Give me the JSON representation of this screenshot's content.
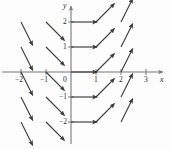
{
  "figure": {
    "background": "#fdfdfd",
    "ink_color": "#3a3a3a",
    "axis_color": "#777777",
    "width": 171,
    "height": 149
  },
  "axes": {
    "x_axis_label": "x",
    "y_axis_label": "y",
    "origin_label": "0",
    "x_ticks": [
      {
        "value": -2,
        "label": "−2",
        "px": 21
      },
      {
        "value": -1,
        "label": "−1",
        "px": 46
      },
      {
        "value": 1,
        "label": "1",
        "px": 96
      },
      {
        "value": 2,
        "label": "2",
        "px": 121
      },
      {
        "value": 3,
        "label": "3",
        "px": 146
      }
    ],
    "y_ticks": [
      {
        "value": 2,
        "label": "2",
        "px": 22
      },
      {
        "value": 1,
        "label": "1",
        "px": 47
      },
      {
        "value": -1,
        "label": "−1",
        "px": 97
      },
      {
        "value": -2,
        "label": "−2",
        "px": 122
      }
    ],
    "origin_px": {
      "x": 71,
      "y": 72
    },
    "unit_px": 25,
    "grid": false
  },
  "chart_data": {
    "type": "scatter",
    "plot_kind": "slope-field",
    "title": "",
    "xlabel": "x",
    "ylabel": "y",
    "xlim": [
      -2.9,
      3.4
    ],
    "ylim": [
      -2.6,
      2.6
    ],
    "xticks": [
      -2,
      -1,
      1,
      2,
      3
    ],
    "yticks": [
      2,
      1,
      -1,
      -2
    ],
    "grid": false,
    "legend": "none",
    "slope_rule": "slope = x",
    "arrow_length": 1.05,
    "arrows": [
      {
        "x": -2,
        "y": 2,
        "slope": -2
      },
      {
        "x": -1,
        "y": 2,
        "slope": -1
      },
      {
        "x": 0,
        "y": 2,
        "slope": 0
      },
      {
        "x": 1,
        "y": 2,
        "slope": 1
      },
      {
        "x": 2,
        "y": 2,
        "slope": 2
      },
      {
        "x": -2,
        "y": 1,
        "slope": -2
      },
      {
        "x": -1,
        "y": 1,
        "slope": -1
      },
      {
        "x": 0,
        "y": 1,
        "slope": 0
      },
      {
        "x": 1,
        "y": 1,
        "slope": 1
      },
      {
        "x": 2,
        "y": 1,
        "slope": 2
      },
      {
        "x": -2,
        "y": 0,
        "slope": -2
      },
      {
        "x": -1,
        "y": 0,
        "slope": -1
      },
      {
        "x": 0,
        "y": 0,
        "slope": 0
      },
      {
        "x": 1,
        "y": 0,
        "slope": 1
      },
      {
        "x": 2,
        "y": 0,
        "slope": 2
      },
      {
        "x": -2,
        "y": -1,
        "slope": -2
      },
      {
        "x": -1,
        "y": -1,
        "slope": -1
      },
      {
        "x": 0,
        "y": -1,
        "slope": 0
      },
      {
        "x": 1,
        "y": -1,
        "slope": 1
      },
      {
        "x": 2,
        "y": -1,
        "slope": 2
      },
      {
        "x": -2,
        "y": -2,
        "slope": -2
      },
      {
        "x": -1,
        "y": -2,
        "slope": -1
      },
      {
        "x": 0,
        "y": -2,
        "slope": 0
      },
      {
        "x": 1,
        "y": -2,
        "slope": 1
      },
      {
        "x": 2,
        "y": -2,
        "slope": 2
      }
    ]
  }
}
